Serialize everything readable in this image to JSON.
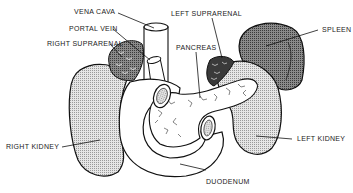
{
  "diagram": {
    "labels": {
      "vena_cava": "VENA CAVA",
      "portal_vein": "PORTAL VEIN",
      "right_suprarenal": "RIGHT SUPRARENAL",
      "left_suprarenal": "LEFT SUPRARENAL",
      "pancreas": "PANCREAS",
      "spleen": "SPLEEN",
      "right_kidney": "RIGHT KIDNEY",
      "left_kidney": "LEFT KIDNEY",
      "duodenum": "DUODENUM"
    },
    "colors": {
      "ink": "#111111",
      "kidney_fill": "#c8c8c8",
      "spleen_fill": "#6a6a6a",
      "suprarenal_fill": "#3a3a3a",
      "organ_fill": "#ffffff",
      "background": "#ffffff"
    }
  }
}
